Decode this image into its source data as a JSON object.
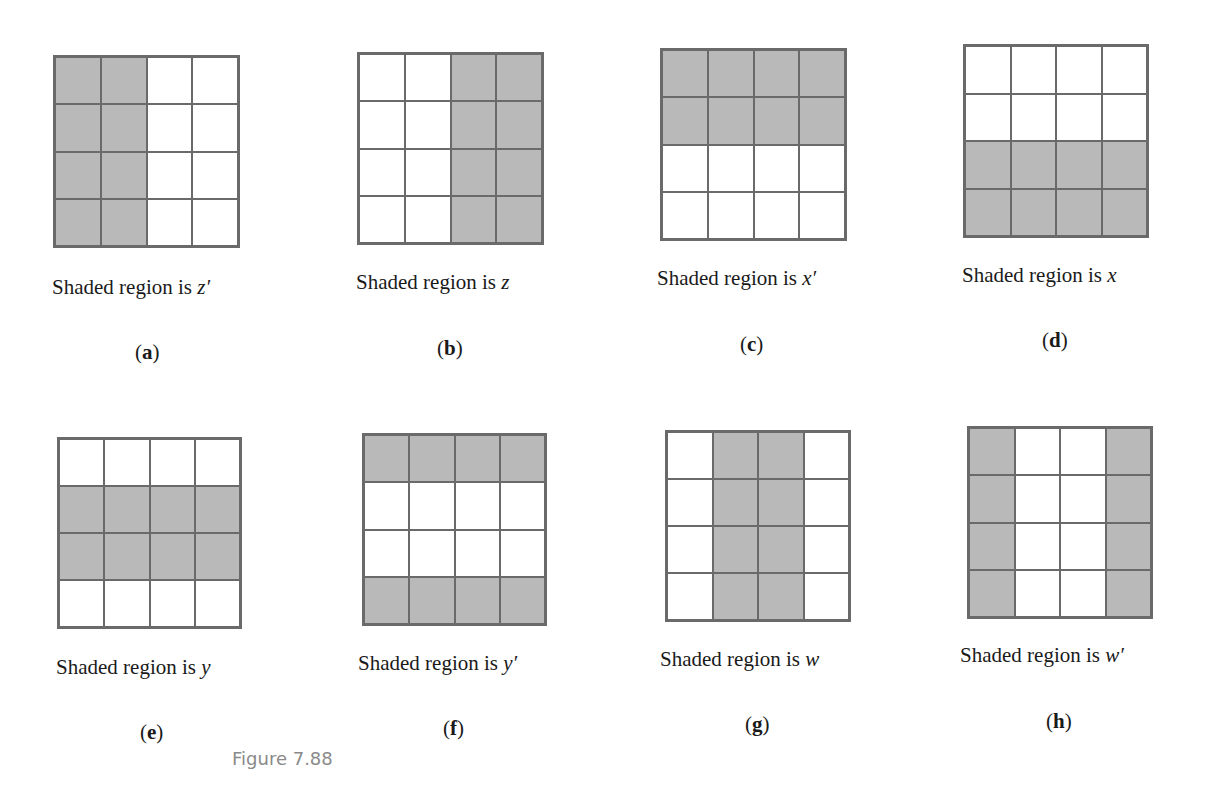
{
  "figure_label": "Figure 7.88",
  "caption_prefix": "Shaded region is ",
  "panels": [
    {
      "id": "a",
      "label": "(a)",
      "variable": "z′",
      "shaded": [
        [
          1,
          1,
          0,
          0
        ],
        [
          1,
          1,
          0,
          0
        ],
        [
          1,
          1,
          0,
          0
        ],
        [
          1,
          1,
          0,
          0
        ]
      ],
      "box": [
        53,
        55,
        187,
        193
      ],
      "cap": [
        52,
        275
      ],
      "lab": [
        135,
        340
      ]
    },
    {
      "id": "b",
      "label": "(b)",
      "variable": "z",
      "shaded": [
        [
          0,
          0,
          1,
          1
        ],
        [
          0,
          0,
          1,
          1
        ],
        [
          0,
          0,
          1,
          1
        ],
        [
          0,
          0,
          1,
          1
        ]
      ],
      "box": [
        357,
        52,
        187,
        193
      ],
      "cap": [
        356,
        270
      ],
      "lab": [
        437,
        336
      ]
    },
    {
      "id": "c",
      "label": "(c)",
      "variable": "x′",
      "shaded": [
        [
          1,
          1,
          1,
          1
        ],
        [
          1,
          1,
          1,
          1
        ],
        [
          0,
          0,
          0,
          0
        ],
        [
          0,
          0,
          0,
          0
        ]
      ],
      "box": [
        660,
        48,
        187,
        193
      ],
      "cap": [
        657,
        266
      ],
      "lab": [
        740,
        332
      ]
    },
    {
      "id": "d",
      "label": "(d)",
      "variable": "x",
      "shaded": [
        [
          0,
          0,
          0,
          0
        ],
        [
          0,
          0,
          0,
          0
        ],
        [
          1,
          1,
          1,
          1
        ],
        [
          1,
          1,
          1,
          1
        ]
      ],
      "box": [
        963,
        44,
        186,
        194
      ],
      "cap": [
        962,
        263
      ],
      "lab": [
        1042,
        328
      ]
    },
    {
      "id": "e",
      "label": "(e)",
      "variable": "y",
      "shaded": [
        [
          0,
          0,
          0,
          0
        ],
        [
          1,
          1,
          1,
          1
        ],
        [
          1,
          1,
          1,
          1
        ],
        [
          0,
          0,
          0,
          0
        ]
      ],
      "box": [
        57,
        437,
        185,
        192
      ],
      "cap": [
        56,
        655
      ],
      "lab": [
        140,
        720
      ]
    },
    {
      "id": "f",
      "label": "(f)",
      "variable": "y′",
      "shaded": [
        [
          1,
          1,
          1,
          1
        ],
        [
          0,
          0,
          0,
          0
        ],
        [
          0,
          0,
          0,
          0
        ],
        [
          1,
          1,
          1,
          1
        ]
      ],
      "box": [
        362,
        433,
        185,
        193
      ],
      "cap": [
        358,
        651
      ],
      "lab": [
        443,
        716
      ]
    },
    {
      "id": "g",
      "label": "(g)",
      "variable": "w",
      "shaded": [
        [
          0,
          1,
          1,
          0
        ],
        [
          0,
          1,
          1,
          0
        ],
        [
          0,
          1,
          1,
          0
        ],
        [
          0,
          1,
          1,
          0
        ]
      ],
      "box": [
        665,
        430,
        186,
        192
      ],
      "cap": [
        660,
        647
      ],
      "lab": [
        745,
        712
      ]
    },
    {
      "id": "h",
      "label": "(h)",
      "variable": "w′",
      "shaded": [
        [
          1,
          0,
          0,
          1
        ],
        [
          1,
          0,
          0,
          1
        ],
        [
          1,
          0,
          0,
          1
        ],
        [
          1,
          0,
          0,
          1
        ]
      ],
      "box": [
        967,
        426,
        186,
        193
      ],
      "cap": [
        960,
        643
      ],
      "lab": [
        1046,
        709
      ]
    }
  ],
  "colors": {
    "shade": "#b9b9b9",
    "line": "#6a6a6a",
    "text": "#1a1a1a",
    "figure_label": "#8a8a8a"
  }
}
